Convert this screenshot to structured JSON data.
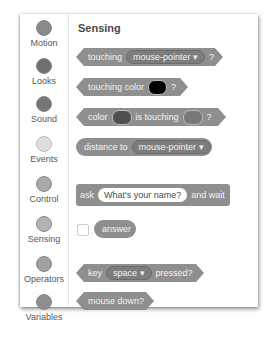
{
  "categories": [
    {
      "label": "Motion",
      "color": "#8a8a8a"
    },
    {
      "label": "Looks",
      "color": "#6e6e6e"
    },
    {
      "label": "Sound",
      "color": "#777777"
    },
    {
      "label": "Events",
      "color": "#dddddd"
    },
    {
      "label": "Control",
      "color": "#a9a9a9"
    },
    {
      "label": "Sensing",
      "color": "#b3b3b3"
    },
    {
      "label": "Operators",
      "color": "#a0a0a0"
    },
    {
      "label": "Variables",
      "color": "#8e8e8e"
    }
  ],
  "palette": {
    "title": "Sensing",
    "blocks": {
      "touching": {
        "prefix": "touching",
        "menu": "mouse-pointer ▾",
        "suffix": "?"
      },
      "touching_color": {
        "prefix": "touching color",
        "suffix": "?",
        "swatch": "#000000"
      },
      "color_touching": {
        "prefix": "color",
        "middle": "is touching",
        "suffix": "?",
        "swatch1": "#4f4f4f",
        "swatch2": "#777777"
      },
      "distance": {
        "prefix": "distance to",
        "menu": "mouse-pointer ▾"
      },
      "ask": {
        "prefix": "ask",
        "input": "What's your name?",
        "suffix": "and wait"
      },
      "answer": {
        "label": "answer"
      },
      "key_pressed": {
        "prefix": "key",
        "menu": "space ▾",
        "suffix": "pressed?"
      },
      "mouse_down": {
        "label": "mouse down?"
      }
    }
  }
}
